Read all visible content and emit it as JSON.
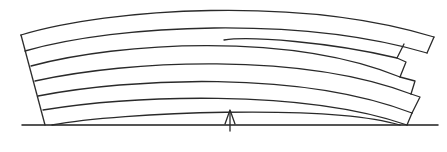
{
  "diagram": {
    "colors": {
      "line": "#2a2a2a",
      "background": "#ffffff"
    },
    "board_count": 6,
    "elements": {
      "baseline": "ground-line",
      "arrow": "up-arrow",
      "boards": [
        "board-1",
        "board-2",
        "board-3",
        "board-4",
        "board-5",
        "board-6"
      ]
    }
  }
}
